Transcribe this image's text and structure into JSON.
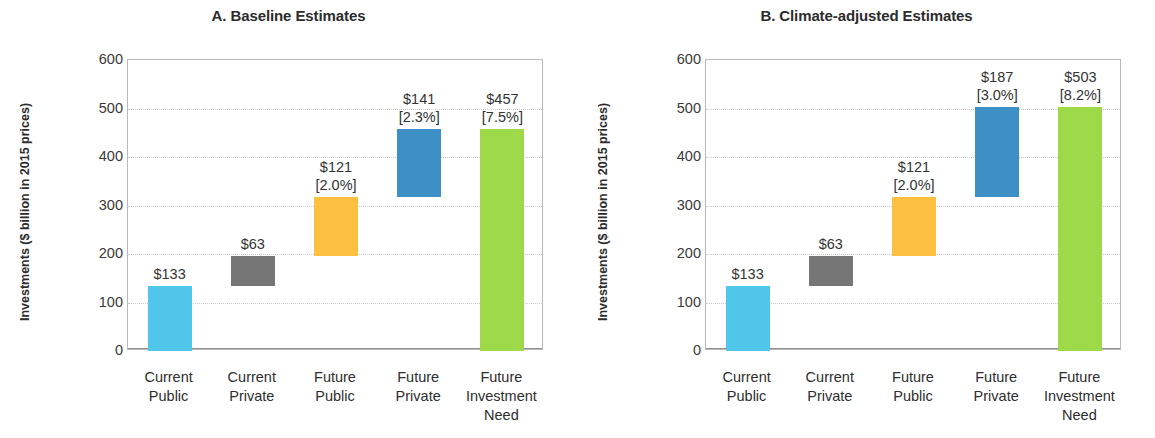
{
  "figure": {
    "ylabel_line1": "Investments",
    "ylabel_line2": "($ billion in 2015 prices)"
  },
  "chart_data": {
    "type": "bar",
    "subtype": "waterfall",
    "xlabel": "",
    "ylabel": "Investments ($ billion in 2015 prices)",
    "ylim": [
      0,
      600
    ],
    "yticks": [
      0,
      100,
      200,
      300,
      400,
      500,
      600
    ],
    "ytick_labels": [
      "0",
      "100",
      "200",
      "300",
      "400",
      "500",
      "600"
    ],
    "grid": true,
    "legend": "none",
    "categories": [
      "Current Public",
      "Current Private",
      "Future Public",
      "Future Private",
      "Future Investment Need"
    ],
    "category_lines": [
      [
        "Current",
        "Public"
      ],
      [
        "Current",
        "Private"
      ],
      [
        "Future",
        "Public"
      ],
      [
        "Future",
        "Private"
      ],
      [
        "Future",
        "Investment",
        "Need"
      ]
    ],
    "colors": {
      "current_public": "#4FC6EA",
      "current_private": "#767676",
      "future_public": "#FBC040",
      "future_private": "#3E8FC6",
      "future_investment_need": "#9ED94A",
      "axis": "#b9b9b9",
      "grid": "#c9c9c9",
      "text": "#333333"
    },
    "panels": [
      {
        "id": "A",
        "title": "A. Baseline Estimates",
        "bars": [
          {
            "category": "Current Public",
            "base": 0,
            "top": 133,
            "value": 133,
            "color_key": "current_public",
            "label": "$133",
            "pct": ""
          },
          {
            "category": "Current Private",
            "base": 133,
            "top": 196,
            "value": 63,
            "color_key": "current_private",
            "label": "$63",
            "pct": ""
          },
          {
            "category": "Future Public",
            "base": 196,
            "top": 317,
            "value": 121,
            "color_key": "future_public",
            "label": "$121",
            "pct": "[2.0%]"
          },
          {
            "category": "Future Private",
            "base": 317,
            "top": 458,
            "value": 141,
            "color_key": "future_private",
            "label": "$141",
            "pct": "[2.3%]"
          },
          {
            "category": "Future Investment Need",
            "base": 0,
            "top": 457,
            "value": 457,
            "color_key": "future_investment_need",
            "label": "$457",
            "pct": "[7.5%]"
          }
        ]
      },
      {
        "id": "B",
        "title": "B. Climate-adjusted Estimates",
        "bars": [
          {
            "category": "Current Public",
            "base": 0,
            "top": 133,
            "value": 133,
            "color_key": "current_public",
            "label": "$133",
            "pct": ""
          },
          {
            "category": "Current Private",
            "base": 133,
            "top": 196,
            "value": 63,
            "color_key": "current_private",
            "label": "$63",
            "pct": ""
          },
          {
            "category": "Future Public",
            "base": 196,
            "top": 317,
            "value": 121,
            "color_key": "future_public",
            "label": "$121",
            "pct": "[2.0%]"
          },
          {
            "category": "Future Private",
            "base": 317,
            "top": 504,
            "value": 187,
            "color_key": "future_private",
            "label": "$187",
            "pct": "[3.0%]"
          },
          {
            "category": "Future Investment Need",
            "base": 0,
            "top": 503,
            "value": 503,
            "color_key": "future_investment_need",
            "label": "$503",
            "pct": "[8.2%]"
          }
        ]
      }
    ]
  }
}
